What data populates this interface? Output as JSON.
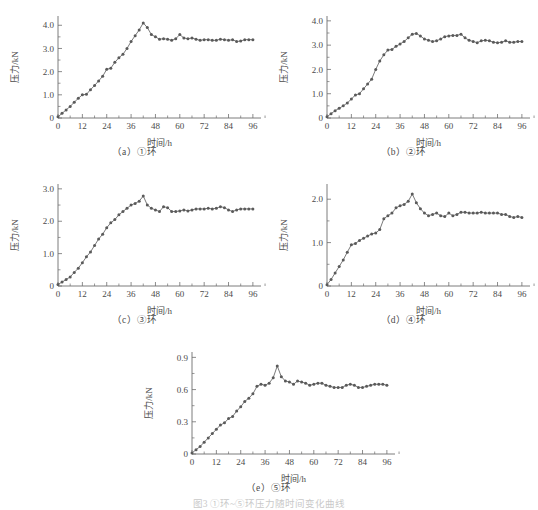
{
  "figure": {
    "caption": "图3 ①环~⑤环压力随时间变化曲线",
    "background": "#ffffff",
    "line_color": "#6b6b6b",
    "marker_color": "#5a5a5a",
    "axis_color": "#6e6e6e"
  },
  "labels": {
    "xlabel": "时间/h",
    "ylabel": "压力/kN"
  },
  "panels": [
    {
      "caption": "（a）①环"
    },
    {
      "caption": "（b）②环"
    },
    {
      "caption": "（c）③环"
    },
    {
      "caption": "（d）④环"
    },
    {
      "caption": "（e）⑤环"
    }
  ],
  "chart_data": [
    {
      "type": "line",
      "title": "（a）①环",
      "xlabel": "时间/h",
      "ylabel": "压力/kN",
      "xlim": [
        0,
        100
      ],
      "ylim": [
        0,
        4.4
      ],
      "xticks": [
        0,
        12,
        24,
        36,
        48,
        60,
        72,
        84,
        96
      ],
      "xticklabels": [
        "0",
        "12",
        "24",
        "36",
        "48",
        "60",
        "72",
        "84",
        "96"
      ],
      "yticks": [
        0,
        1.0,
        2.0,
        3.0,
        4.0
      ],
      "yticklabels": [
        "0",
        "1.0",
        "2.0",
        "3.0",
        "4.0"
      ],
      "grid": false,
      "legend": "none",
      "markers": "filled-circle",
      "x": [
        0,
        2,
        4,
        6,
        8,
        10,
        12,
        14,
        16,
        18,
        20,
        22,
        24,
        26,
        28,
        30,
        32,
        34,
        36,
        38,
        40,
        42,
        44,
        46,
        48,
        50,
        52,
        54,
        56,
        58,
        60,
        62,
        64,
        66,
        68,
        70,
        72,
        74,
        76,
        78,
        80,
        82,
        84,
        86,
        88,
        90,
        92,
        94,
        96
      ],
      "y": [
        0.05,
        0.2,
        0.35,
        0.5,
        0.68,
        0.85,
        1.0,
        1.02,
        1.22,
        1.4,
        1.6,
        1.8,
        2.1,
        2.15,
        2.4,
        2.6,
        2.75,
        3.0,
        3.3,
        3.55,
        3.8,
        4.1,
        3.9,
        3.6,
        3.5,
        3.4,
        3.42,
        3.4,
        3.35,
        3.42,
        3.6,
        3.45,
        3.42,
        3.45,
        3.4,
        3.35,
        3.38,
        3.38,
        3.35,
        3.35,
        3.4,
        3.38,
        3.35,
        3.38,
        3.3,
        3.32,
        3.38,
        3.38,
        3.38
      ]
    },
    {
      "type": "line",
      "title": "（b）②环",
      "xlabel": "时间/h",
      "ylabel": "压力/kN",
      "xlim": [
        0,
        100
      ],
      "ylim": [
        0,
        4.2
      ],
      "xticks": [
        0,
        12,
        24,
        36,
        48,
        60,
        72,
        84,
        96
      ],
      "xticklabels": [
        "0",
        "12",
        "24",
        "36",
        "48",
        "60",
        "72",
        "84",
        "96"
      ],
      "yticks": [
        0,
        1.0,
        2.0,
        3.0,
        4.0
      ],
      "yticklabels": [
        "0",
        "1.0",
        "2.0",
        "3.0",
        "4.0"
      ],
      "grid": false,
      "legend": "none",
      "markers": "filled-circle",
      "x": [
        0,
        2,
        4,
        6,
        8,
        10,
        12,
        14,
        16,
        18,
        20,
        22,
        24,
        26,
        28,
        30,
        32,
        34,
        36,
        38,
        40,
        42,
        44,
        46,
        48,
        50,
        52,
        54,
        56,
        58,
        60,
        62,
        64,
        66,
        68,
        70,
        72,
        74,
        76,
        78,
        80,
        82,
        84,
        86,
        88,
        90,
        92,
        94,
        96
      ],
      "y": [
        0.05,
        0.18,
        0.3,
        0.4,
        0.5,
        0.62,
        0.78,
        0.95,
        1.0,
        1.2,
        1.4,
        1.6,
        2.0,
        2.35,
        2.6,
        2.8,
        2.82,
        2.95,
        3.05,
        3.15,
        3.3,
        3.45,
        3.48,
        3.38,
        3.25,
        3.2,
        3.15,
        3.18,
        3.25,
        3.35,
        3.38,
        3.4,
        3.4,
        3.45,
        3.3,
        3.2,
        3.15,
        3.1,
        3.18,
        3.2,
        3.18,
        3.12,
        3.1,
        3.12,
        3.18,
        3.12,
        3.12,
        3.15,
        3.15
      ]
    },
    {
      "type": "line",
      "title": "（c）③环",
      "xlabel": "时间/h",
      "ylabel": "压力/kN",
      "xlim": [
        0,
        100
      ],
      "ylim": [
        0,
        3.15
      ],
      "xticks": [
        0,
        12,
        24,
        36,
        48,
        60,
        72,
        84,
        96
      ],
      "xticklabels": [
        "0",
        "12",
        "24",
        "36",
        "48",
        "60",
        "72",
        "84",
        "96"
      ],
      "yticks": [
        0,
        1.0,
        2.0,
        3.0
      ],
      "yticklabels": [
        "0",
        "1.0",
        "2.0",
        "3.0"
      ],
      "grid": false,
      "legend": "none",
      "markers": "filled-circle",
      "x": [
        0,
        2,
        4,
        6,
        8,
        10,
        12,
        14,
        16,
        18,
        20,
        22,
        24,
        26,
        28,
        30,
        32,
        34,
        36,
        38,
        40,
        42,
        44,
        46,
        48,
        50,
        52,
        54,
        56,
        58,
        60,
        62,
        64,
        66,
        68,
        70,
        72,
        74,
        76,
        78,
        80,
        82,
        84,
        86,
        88,
        90,
        92,
        94,
        96
      ],
      "y": [
        0.05,
        0.12,
        0.2,
        0.28,
        0.42,
        0.55,
        0.72,
        0.9,
        1.05,
        1.25,
        1.45,
        1.6,
        1.8,
        1.95,
        2.05,
        2.2,
        2.3,
        2.4,
        2.5,
        2.55,
        2.62,
        2.78,
        2.5,
        2.4,
        2.35,
        2.3,
        2.45,
        2.42,
        2.3,
        2.3,
        2.32,
        2.35,
        2.32,
        2.35,
        2.38,
        2.38,
        2.38,
        2.4,
        2.38,
        2.4,
        2.45,
        2.42,
        2.35,
        2.3,
        2.35,
        2.38,
        2.38,
        2.38,
        2.38
      ]
    },
    {
      "type": "line",
      "title": "（d）④环",
      "xlabel": "时间/h",
      "ylabel": "压力/kN",
      "xlim": [
        0,
        100
      ],
      "ylim": [
        0,
        2.35
      ],
      "xticks": [
        0,
        12,
        24,
        36,
        48,
        60,
        72,
        84,
        96
      ],
      "xticklabels": [
        "0",
        "12",
        "24",
        "36",
        "48",
        "60",
        "72",
        "84",
        "96"
      ],
      "yticks": [
        0,
        1.0,
        2.0
      ],
      "yticklabels": [
        "0",
        "1.0",
        "2.0"
      ],
      "grid": false,
      "legend": "none",
      "markers": "filled-circle",
      "x": [
        0,
        2,
        4,
        6,
        8,
        10,
        12,
        14,
        16,
        18,
        20,
        22,
        24,
        26,
        28,
        30,
        32,
        34,
        36,
        38,
        40,
        42,
        44,
        46,
        48,
        50,
        52,
        54,
        56,
        58,
        60,
        62,
        64,
        66,
        68,
        70,
        72,
        74,
        76,
        78,
        80,
        82,
        84,
        86,
        88,
        90,
        92,
        94,
        96
      ],
      "y": [
        0.03,
        0.15,
        0.3,
        0.45,
        0.6,
        0.78,
        0.95,
        0.98,
        1.05,
        1.1,
        1.15,
        1.2,
        1.22,
        1.3,
        1.55,
        1.62,
        1.68,
        1.8,
        1.85,
        1.88,
        1.95,
        2.12,
        1.92,
        1.78,
        1.68,
        1.62,
        1.65,
        1.68,
        1.62,
        1.6,
        1.68,
        1.62,
        1.65,
        1.7,
        1.7,
        1.68,
        1.68,
        1.68,
        1.7,
        1.68,
        1.68,
        1.68,
        1.68,
        1.65,
        1.65,
        1.6,
        1.58,
        1.6,
        1.58
      ]
    },
    {
      "type": "line",
      "title": "（e）⑤环",
      "xlabel": "时间/h",
      "ylabel": "压力/kN",
      "xlim": [
        0,
        100
      ],
      "ylim": [
        0,
        0.95
      ],
      "xticks": [
        0,
        12,
        24,
        36,
        48,
        60,
        72,
        84,
        96
      ],
      "xticklabels": [
        "0",
        "12",
        "24",
        "36",
        "48",
        "60",
        "72",
        "84",
        "96"
      ],
      "yticks": [
        0,
        0.3,
        0.6,
        0.9
      ],
      "yticklabels": [
        "0",
        "0.3",
        "0.6",
        "0.9"
      ],
      "grid": false,
      "legend": "none",
      "markers": "filled-circle",
      "x": [
        0,
        2,
        4,
        6,
        8,
        10,
        12,
        14,
        16,
        18,
        20,
        22,
        24,
        26,
        28,
        30,
        32,
        34,
        36,
        38,
        40,
        42,
        44,
        46,
        48,
        50,
        52,
        54,
        56,
        58,
        60,
        62,
        64,
        66,
        68,
        70,
        72,
        74,
        76,
        78,
        80,
        82,
        84,
        86,
        88,
        90,
        92,
        94,
        96
      ],
      "y": [
        0.01,
        0.04,
        0.07,
        0.11,
        0.15,
        0.19,
        0.23,
        0.27,
        0.29,
        0.33,
        0.35,
        0.4,
        0.44,
        0.49,
        0.52,
        0.56,
        0.63,
        0.65,
        0.64,
        0.66,
        0.71,
        0.82,
        0.72,
        0.68,
        0.67,
        0.65,
        0.68,
        0.67,
        0.66,
        0.64,
        0.65,
        0.66,
        0.66,
        0.64,
        0.63,
        0.62,
        0.62,
        0.62,
        0.64,
        0.65,
        0.64,
        0.62,
        0.62,
        0.63,
        0.64,
        0.65,
        0.65,
        0.65,
        0.64
      ]
    }
  ]
}
